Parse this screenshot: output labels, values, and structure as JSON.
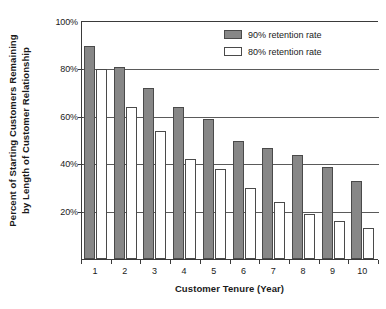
{
  "chart_data": {
    "type": "bar",
    "title": "",
    "subtitle": "",
    "xlabel": "Customer Tenure (Year)",
    "ylabel_line1": "Percent of Starting Customers Remaining",
    "ylabel_line2": "by Length of Customer Relationship",
    "categories": [
      "1",
      "2",
      "3",
      "4",
      "5",
      "6",
      "7",
      "8",
      "9",
      "10"
    ],
    "series": [
      {
        "name": "90% retention rate",
        "color": "#878787",
        "values": [
          90,
          81,
          72,
          64,
          59,
          50,
          47,
          44,
          39,
          33
        ]
      },
      {
        "name": "80% retention rate",
        "color": "#ffffff",
        "values": [
          80,
          64,
          54,
          42,
          38,
          30,
          24,
          19,
          16,
          13
        ]
      }
    ],
    "ylim": [
      0,
      100
    ],
    "yticks": [
      20,
      40,
      60,
      80,
      100
    ],
    "ytick_labels": [
      "20%",
      "40%",
      "60%",
      "80%",
      "100%"
    ],
    "grid": "horizontal",
    "legend_position": "top-right"
  },
  "legend": {
    "entries": [
      {
        "label": "90% retention rate",
        "swatch": "s90"
      },
      {
        "label": "80% retention rate",
        "swatch": "s80"
      }
    ]
  }
}
